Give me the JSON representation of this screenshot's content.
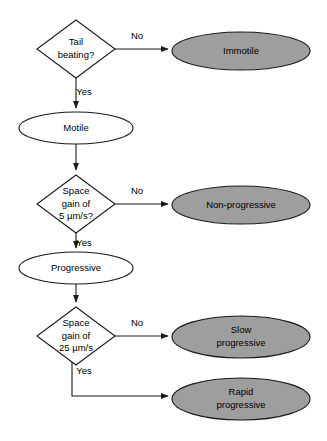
{
  "diagram": {
    "type": "flowchart",
    "palette": {
      "terminal_fill": "#9e9e9e",
      "node_fill": "#ffffff",
      "stroke": "#1a1a1a",
      "text": "#000000",
      "background": "#ffffff"
    },
    "nodes": [
      {
        "id": "tail-beating",
        "kind": "decision",
        "lines": [
          "Tail",
          "beating?"
        ],
        "cx": 76,
        "cy": 49,
        "rx": 39,
        "ry": 29
      },
      {
        "id": "immotile",
        "kind": "terminal",
        "lines": [
          "Immotile"
        ],
        "cx": 241,
        "cy": 51,
        "rx": 69,
        "ry": 19
      },
      {
        "id": "motile",
        "kind": "state",
        "lines": [
          "Motile"
        ],
        "cx": 76,
        "cy": 128,
        "rx": 57,
        "ry": 16
      },
      {
        "id": "space-gain-5",
        "kind": "decision",
        "lines": [
          "Space",
          "gain of",
          "5 µm/s?"
        ],
        "cx": 76,
        "cy": 204,
        "rx": 39,
        "ry": 29
      },
      {
        "id": "non-progressive",
        "kind": "terminal",
        "lines": [
          "Non-progressive"
        ],
        "cx": 241,
        "cy": 205,
        "rx": 69,
        "ry": 19
      },
      {
        "id": "progressive",
        "kind": "state",
        "lines": [
          "Progressive"
        ],
        "cx": 76,
        "cy": 268,
        "rx": 57,
        "ry": 16
      },
      {
        "id": "space-gain-25",
        "kind": "decision",
        "lines": [
          "Space",
          "gain of",
          "25 µm/s"
        ],
        "cx": 76,
        "cy": 336,
        "rx": 39,
        "ry": 29
      },
      {
        "id": "slow-progressive",
        "kind": "terminal",
        "lines": [
          "Slow",
          "progressive"
        ],
        "cx": 241,
        "cy": 337,
        "rx": 69,
        "ry": 21
      },
      {
        "id": "rapid-progressive",
        "kind": "terminal",
        "lines": [
          "Rapid",
          "progressive"
        ],
        "cx": 241,
        "cy": 399,
        "rx": 69,
        "ry": 21
      }
    ],
    "edges": [
      {
        "id": "tail-no",
        "from": "tail-beating",
        "to": "immotile",
        "label": "No",
        "label_x": 137,
        "label_y": 36,
        "path": "M 115 49 L 168 49"
      },
      {
        "id": "tail-yes",
        "from": "tail-beating",
        "to": "motile",
        "label": "Yes",
        "label_x": 84,
        "label_y": 92,
        "path": "M 76 78 L 76 108"
      },
      {
        "id": "motile-to-gain5",
        "from": "motile",
        "to": "space-gain-5",
        "label": "",
        "label_x": 0,
        "label_y": 0,
        "path": "M 76 144 L 76 170"
      },
      {
        "id": "gain5-no",
        "from": "space-gain-5",
        "to": "non-progressive",
        "label": "No",
        "label_x": 137,
        "label_y": 191,
        "path": "M 115 204 L 168 204"
      },
      {
        "id": "gain5-yes",
        "from": "space-gain-5",
        "to": "progressive",
        "label": "Yes",
        "label_x": 84,
        "label_y": 243,
        "path": "M 76 233 L 76 248"
      },
      {
        "id": "progressive-to-gain25",
        "from": "progressive",
        "to": "space-gain-25",
        "label": "",
        "label_x": 0,
        "label_y": 0,
        "path": "M 76 284 L 76 302"
      },
      {
        "id": "gain25-no",
        "from": "space-gain-25",
        "to": "slow-progressive",
        "label": "No",
        "label_x": 137,
        "label_y": 323,
        "path": "M 115 336 L 168 336"
      },
      {
        "id": "gain25-yes",
        "from": "space-gain-25",
        "to": "rapid-progressive",
        "label": "Yes",
        "label_x": 84,
        "label_y": 371,
        "path": "M 72 357 L 72 396 L 168 396"
      }
    ]
  }
}
